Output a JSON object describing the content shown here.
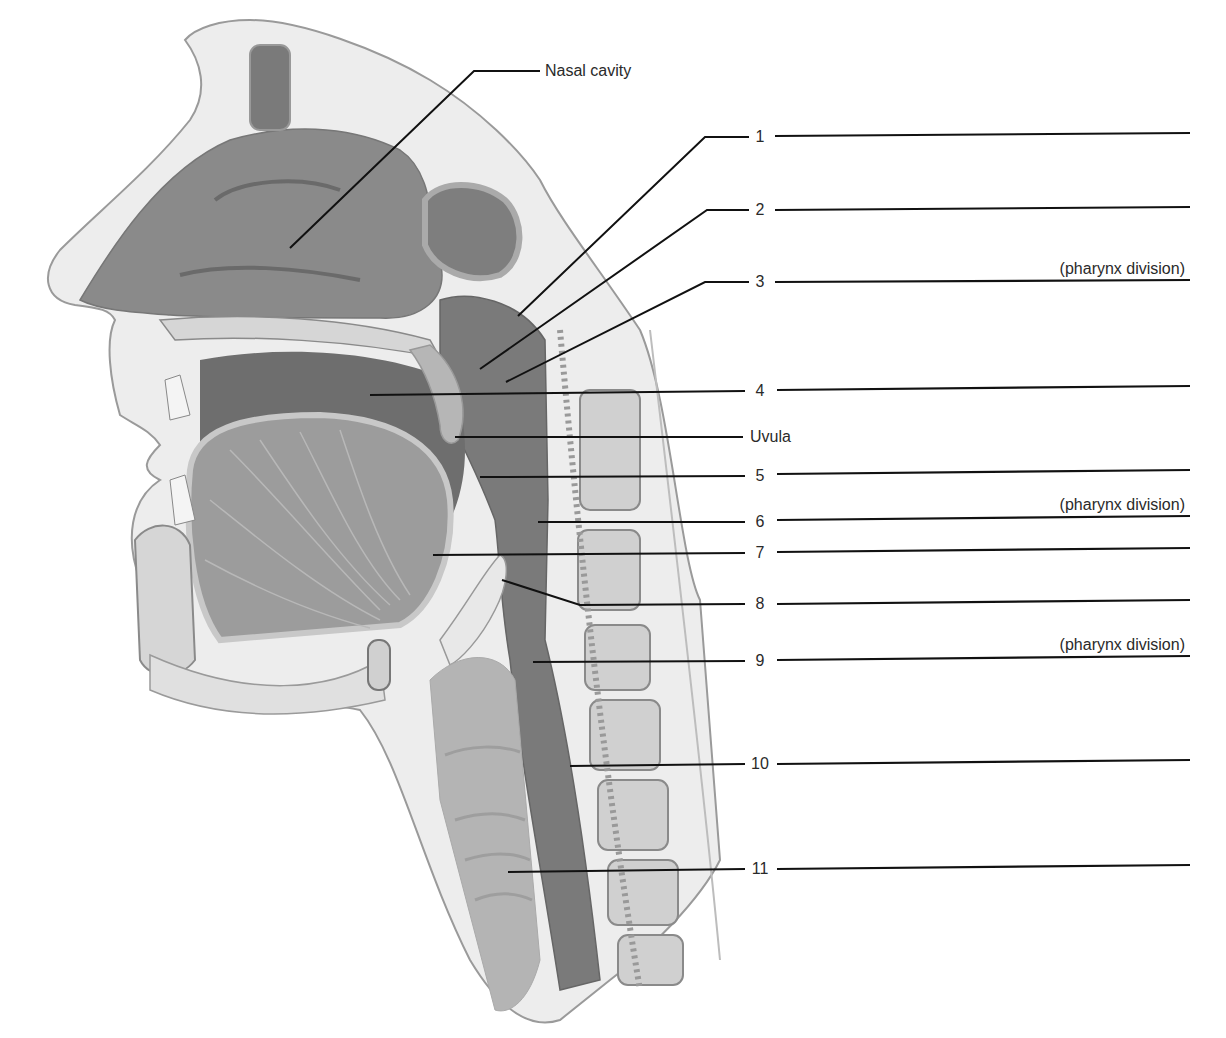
{
  "figure": {
    "named_labels": [
      {
        "id": "nasal-cavity",
        "text": "Nasal cavity",
        "x": 545,
        "y": 71,
        "leader": [
          [
            290,
            248
          ],
          [
            474,
            71
          ],
          [
            540,
            71
          ]
        ]
      },
      {
        "id": "uvula",
        "text": "Uvula",
        "x": 750,
        "y": 437,
        "leader": [
          [
            455,
            437
          ],
          [
            743,
            437
          ]
        ]
      }
    ],
    "numbered_labels": [
      {
        "n": "1",
        "x": 760,
        "y": 137,
        "leader": [
          [
            518,
            316
          ],
          [
            705,
            137
          ],
          [
            749,
            137
          ]
        ],
        "blank": [
          [
            775,
            136
          ],
          [
            1190,
            133
          ]
        ],
        "division": false
      },
      {
        "n": "2",
        "x": 760,
        "y": 210,
        "leader": [
          [
            480,
            369
          ],
          [
            707,
            210
          ],
          [
            749,
            210
          ]
        ],
        "blank": [
          [
            775,
            210
          ],
          [
            1190,
            207
          ]
        ],
        "division": false
      },
      {
        "n": "3",
        "x": 760,
        "y": 282,
        "leader": [
          [
            506,
            382
          ],
          [
            705,
            282
          ],
          [
            749,
            282
          ]
        ],
        "blank": [
          [
            775,
            282
          ],
          [
            1190,
            280
          ]
        ],
        "division": true
      },
      {
        "n": "4",
        "x": 760,
        "y": 391,
        "leader": [
          [
            370,
            395
          ],
          [
            745,
            391
          ]
        ],
        "blank": [
          [
            777,
            390
          ],
          [
            1190,
            386
          ]
        ],
        "division": false
      },
      {
        "n": "5",
        "x": 760,
        "y": 476,
        "leader": [
          [
            480,
            477
          ],
          [
            745,
            476
          ]
        ],
        "blank": [
          [
            777,
            474
          ],
          [
            1190,
            470
          ]
        ],
        "division": false
      },
      {
        "n": "6",
        "x": 760,
        "y": 522,
        "leader": [
          [
            538,
            522
          ],
          [
            745,
            522
          ]
        ],
        "blank": [
          [
            777,
            520
          ],
          [
            1190,
            516
          ]
        ],
        "division": true
      },
      {
        "n": "7",
        "x": 760,
        "y": 553,
        "leader": [
          [
            433,
            555
          ],
          [
            745,
            553
          ]
        ],
        "blank": [
          [
            777,
            552
          ],
          [
            1190,
            548
          ]
        ],
        "division": false
      },
      {
        "n": "8",
        "x": 760,
        "y": 604,
        "leader": [
          [
            502,
            580
          ],
          [
            580,
            605
          ],
          [
            745,
            604
          ]
        ],
        "blank": [
          [
            777,
            604
          ],
          [
            1190,
            600
          ]
        ],
        "division": false
      },
      {
        "n": "9",
        "x": 760,
        "y": 661,
        "leader": [
          [
            533,
            662
          ],
          [
            745,
            661
          ]
        ],
        "blank": [
          [
            777,
            660
          ],
          [
            1190,
            656
          ]
        ],
        "division": true
      },
      {
        "n": "10",
        "x": 760,
        "y": 764,
        "leader": [
          [
            570,
            766
          ],
          [
            745,
            764
          ]
        ],
        "blank": [
          [
            777,
            764
          ],
          [
            1190,
            760
          ]
        ],
        "division": false
      },
      {
        "n": "11",
        "x": 760,
        "y": 869,
        "leader": [
          [
            508,
            872
          ],
          [
            745,
            869
          ]
        ],
        "blank": [
          [
            777,
            869
          ],
          [
            1190,
            865
          ]
        ],
        "division": false
      }
    ],
    "division_text": "(pharynx division)",
    "colors": {
      "line": "#111111",
      "cavity_dark": "#6f6f6f",
      "cavity_mid": "#8c8c8c",
      "tissue_light": "#e4e4e4",
      "bone_fill": "#d2d2d2",
      "outline": "#8a8a8a"
    }
  }
}
